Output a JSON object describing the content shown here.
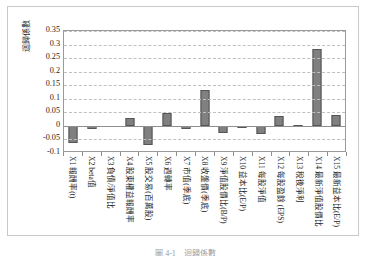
{
  "figure": {
    "caption": "圖 4-1　迴歸係數",
    "background_color": "#ffffff",
    "frame_color": "#c9c9c9"
  },
  "chart_data": {
    "type": "bar",
    "title": "",
    "subtitle": "",
    "xlabel": "",
    "ylabel": "迴歸係數",
    "ylim": [
      -0.1,
      0.35
    ],
    "yticks": [
      0.35,
      0.3,
      0.25,
      0.2,
      0.15,
      0.1,
      0.05,
      0,
      -0.05,
      -0.1
    ],
    "ytick_labels": [
      "0.35",
      "0.3",
      "0.25",
      "0.2",
      "0.15",
      "0.1",
      "0.05",
      "0",
      "-0.05",
      "-0.1"
    ],
    "grid": true,
    "grid_orientation": "horizontal",
    "legend": false,
    "legend_position": "none",
    "bar_color": "#808080",
    "bar_border_color": "#555555",
    "categories": [
      "X1 報酬率(t)",
      "X2 beta值",
      "X3 負債/淨值比",
      "X4 股東權益報酬率",
      "X5 股交易(百萬股)",
      "X6 週轉率",
      "X7 市值(季底)",
      "X8 收盤價(季底)",
      "X9 淨值股價比(B/P)",
      "X10 益本比(E/P)",
      "X11 每股淨值",
      "X12 每股盈餘 (EPS)",
      "X13 稅後淨利",
      "X14 最新淨值股價比",
      "X15 最新益本比(E/P)"
    ],
    "values": [
      -0.065,
      -0.013,
      0.0,
      0.03,
      -0.07,
      0.048,
      -0.012,
      0.132,
      -0.027,
      -0.008,
      -0.03,
      0.038,
      0.005,
      0.285,
      0.04
    ]
  }
}
